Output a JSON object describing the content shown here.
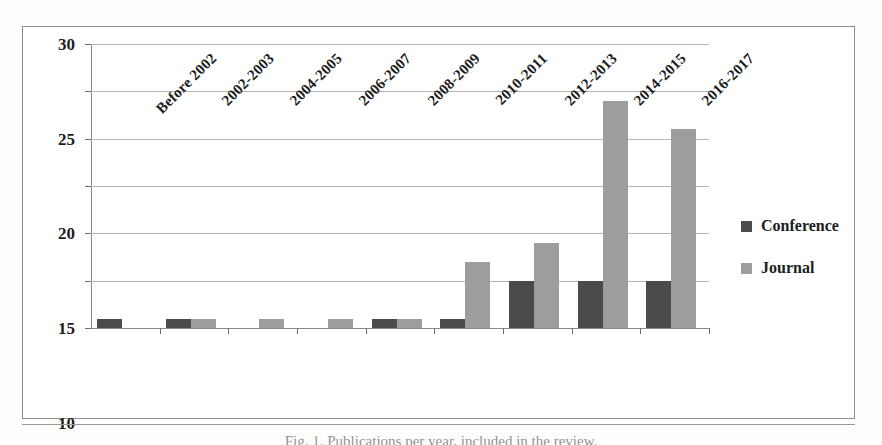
{
  "figure": {
    "caption": "Fig. 1. Publications per year, included in the review.",
    "frame_border_color": "#8d8d8d"
  },
  "legend": {
    "position": "right",
    "items": [
      {
        "label": "Conference",
        "color": "#4b4b4b",
        "icon": "square-swatch-icon"
      },
      {
        "label": "Journal",
        "color": "#9d9d9d",
        "icon": "square-swatch-icon"
      }
    ]
  },
  "axis": {
    "y_ticks": [
      "0",
      "5",
      "10",
      "15",
      "20",
      "25",
      "30"
    ],
    "x_ticks": [
      "Before 2002",
      "2002-2003",
      "2004-2005",
      "2006-2007",
      "2008-2009",
      "2010-2011",
      "2012-2013",
      "2014-2015",
      "2016-2017"
    ]
  },
  "chart_data": {
    "type": "bar",
    "title": "",
    "subtitle": "",
    "xlabel": "",
    "ylabel": "",
    "ylim": [
      0,
      30
    ],
    "ytick_step": 5,
    "grid": true,
    "legend_position": "right",
    "categories": [
      "Before 2002",
      "2002-2003",
      "2004-2005",
      "2006-2007",
      "2008-2009",
      "2010-2011",
      "2012-2013",
      "2014-2015",
      "2016-2017"
    ],
    "series": [
      {
        "name": "Conference",
        "color": "#4b4b4b",
        "values": [
          1,
          1,
          0,
          0,
          1,
          1,
          5,
          5,
          5
        ]
      },
      {
        "name": "Journal",
        "color": "#9d9d9d",
        "values": [
          0,
          1,
          1,
          1,
          1,
          7,
          9,
          24,
          21
        ]
      }
    ]
  }
}
